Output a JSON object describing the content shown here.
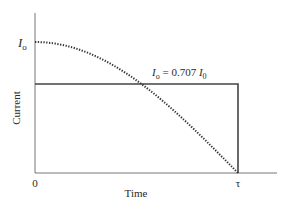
{
  "chart_data": {
    "type": "line",
    "title": "",
    "xlabel": "Time",
    "ylabel": "Current",
    "x_ticks": [
      "0",
      "τ"
    ],
    "y_ticks": [
      "I0"
    ],
    "grid": false,
    "legend": null,
    "series": [
      {
        "name": "Sinusoidal current (quarter cycle)",
        "style": "dotted",
        "x": [
          0,
          0.1,
          0.2,
          0.3,
          0.4,
          0.5,
          0.6,
          0.7,
          0.8,
          0.9,
          1.0
        ],
        "y": [
          1.0,
          0.988,
          0.951,
          0.891,
          0.809,
          0.707,
          0.588,
          0.454,
          0.309,
          0.156,
          0.0
        ]
      },
      {
        "name": "Equivalent constant current (rectangular pulse)",
        "style": "solid",
        "x": [
          0,
          1.0,
          1.0
        ],
        "y": [
          0.707,
          0.707,
          0.0
        ]
      }
    ],
    "annotations": [
      {
        "text": "Io = 0.707 I0",
        "position": "above rectangle top, right of center"
      }
    ],
    "x_range": [
      0,
      1.15
    ],
    "y_range": [
      0,
      1.2
    ]
  },
  "labels": {
    "ylabel": "Current",
    "xlabel": "Time",
    "x_origin": "0",
    "x_tau": "τ",
    "y_i0_main": "I",
    "y_i0_sub": "o",
    "annotation_lhs_main": "I",
    "annotation_lhs_sub": "o",
    "annotation_eq": " = 0.707 ",
    "annotation_rhs_main": "I",
    "annotation_rhs_sub": "0"
  }
}
